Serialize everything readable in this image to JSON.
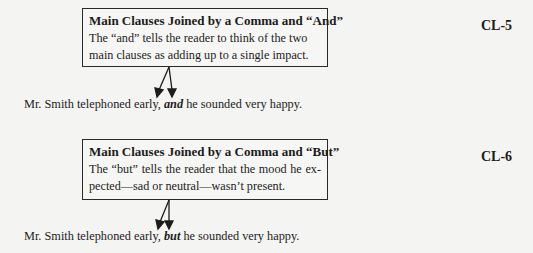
{
  "examples": [
    {
      "label": "CL-5",
      "box": {
        "title": "Main Clauses Joined by a Comma and “And”",
        "text": "The “and” tells the reader to think of the two main clauses as adding up to a single impact."
      },
      "sentence": {
        "before": "Mr. Smith telephoned early, ",
        "conjunction": "and",
        "after": " he sounded very happy."
      }
    },
    {
      "label": "CL-6",
      "box": {
        "title": "Main Clauses Joined by a Comma and “But”",
        "text": "The “but” tells the reader that the mood he ex-pected—sad or neutral—wasn’t present."
      },
      "sentence": {
        "before": "Mr. Smith telephoned early, ",
        "conjunction": "but",
        "after": " he sounded very happy."
      }
    }
  ],
  "colors": {
    "background": "#f4f4f2",
    "ink": "#1c1c1c"
  }
}
